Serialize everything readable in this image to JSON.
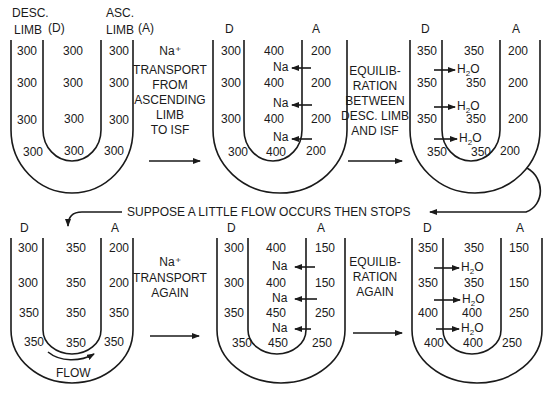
{
  "figure": {
    "top_left_labels": {
      "desc_limb": [
        "DESC.",
        "LIMB"
      ],
      "desc_abbrev": "(D)",
      "asc_limb": [
        "ASC.",
        "LIMB"
      ],
      "asc_abbrev": "(A)"
    },
    "limb_labels": {
      "d": "D",
      "a": "A"
    },
    "stages": [
      {
        "id": "initial",
        "desc": [
          "300",
          "300",
          "300",
          "300"
        ],
        "isf": [
          "300",
          "300",
          "300",
          "300"
        ],
        "asc": [
          "300",
          "300",
          "300",
          "300"
        ],
        "flux_labels": [],
        "flux_direction": ""
      },
      {
        "id": "na-transport",
        "desc": [
          "300",
          "300",
          "300",
          "300"
        ],
        "isf": [
          "400",
          "400",
          "400",
          "400"
        ],
        "asc": [
          "200",
          "200",
          "200",
          "200"
        ],
        "flux_labels": [
          "Na",
          "Na",
          "Na"
        ],
        "flux_direction": "asc-to-isf"
      },
      {
        "id": "equilibration",
        "desc": [
          "350",
          "350",
          "350",
          "350"
        ],
        "isf": [
          "350",
          "350",
          "350",
          "350"
        ],
        "asc": [
          "200",
          "200",
          "200",
          "200"
        ],
        "flux_labels": [
          "H2O",
          "H2O",
          "H2O"
        ],
        "flux_direction": "desc-to-isf"
      },
      {
        "id": "flow",
        "desc": [
          "300",
          "300",
          "350",
          "350"
        ],
        "isf": [
          "350",
          "350",
          "350",
          "350"
        ],
        "asc": [
          "200",
          "200",
          "350",
          "350"
        ],
        "flux_labels": [],
        "flux_direction": "",
        "flow_label": "FLOW"
      },
      {
        "id": "na-transport-again",
        "desc": [
          "300",
          "300",
          "350",
          "350"
        ],
        "isf": [
          "400",
          "400",
          "450",
          "450"
        ],
        "asc": [
          "150",
          "150",
          "250",
          "250"
        ],
        "flux_labels": [
          "Na",
          "Na",
          "Na"
        ],
        "flux_direction": "asc-to-isf"
      },
      {
        "id": "equilibration-again",
        "desc": [
          "350",
          "350",
          "400",
          "400"
        ],
        "isf": [
          "350",
          "350",
          "400",
          "400"
        ],
        "asc": [
          "150",
          "150",
          "250",
          "250"
        ],
        "flux_labels": [
          "H2O",
          "H2O",
          "H2O"
        ],
        "flux_direction": "desc-to-isf"
      }
    ],
    "step_captions": {
      "step1": [
        "Na⁺",
        "TRANSPORT",
        "FROM",
        "ASCENDING",
        "LIMB",
        "TO ISF"
      ],
      "step2": [
        "EQUILIB-",
        "RATION",
        "BETWEEN",
        "DESC. LIMB",
        "AND ISF"
      ],
      "step3": [
        "Na⁺",
        "TRANSPORT",
        "AGAIN"
      ],
      "step4": [
        "EQUILIB-",
        "RATION",
        "AGAIN"
      ]
    },
    "transition_caption": "SUPPOSE A LITTLE FLOW OCCURS THEN STOPS",
    "colors": {
      "ink": "#1a1a1a",
      "background": "#ffffff"
    }
  }
}
